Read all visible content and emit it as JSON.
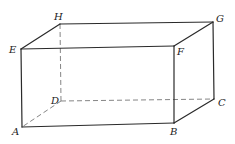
{
  "diagram": {
    "type": "rectangular-prism",
    "vertices": {
      "A": {
        "label": "A",
        "x": 22,
        "y": 127,
        "lx": 12,
        "ly": 135
      },
      "B": {
        "label": "B",
        "x": 174,
        "y": 123,
        "lx": 171,
        "ly": 135
      },
      "C": {
        "label": "C",
        "x": 214,
        "y": 99,
        "lx": 218,
        "ly": 106
      },
      "D": {
        "label": "D",
        "x": 61,
        "y": 101,
        "lx": 51,
        "ly": 104
      },
      "E": {
        "label": "E",
        "x": 21,
        "y": 49,
        "lx": 9,
        "ly": 53
      },
      "F": {
        "label": "F",
        "x": 174,
        "y": 46,
        "lx": 177,
        "ly": 55
      },
      "G": {
        "label": "G",
        "x": 213,
        "y": 22,
        "lx": 216,
        "ly": 22
      },
      "H": {
        "label": "H",
        "x": 60,
        "y": 24,
        "lx": 54,
        "ly": 20
      }
    },
    "solid_edges": [
      "EF",
      "FB",
      "BA",
      "AE",
      "EH",
      "HG",
      "GF",
      "GC",
      "CB"
    ],
    "dashed_edges": [
      "HD",
      "DC",
      "DA"
    ]
  }
}
